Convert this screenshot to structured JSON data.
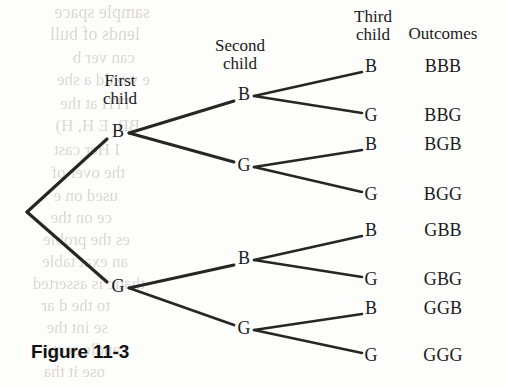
{
  "figure": {
    "caption": "Figure 11-3",
    "caption_x": 31,
    "caption_y": 341
  },
  "columns": [
    {
      "name": "first-child",
      "line1": "First",
      "line2": "child",
      "x": 120,
      "y": 72
    },
    {
      "name": "second-child",
      "line1": "Second",
      "line2": "child",
      "x": 240,
      "y": 37
    },
    {
      "name": "third-child",
      "line1": "Third",
      "line2": "child",
      "x": 373,
      "y": 8
    },
    {
      "name": "outcomes",
      "line1": "Outcomes",
      "line2": "",
      "x": 443,
      "y": 25
    }
  ],
  "tree": {
    "root": {
      "x": 27,
      "y": 212
    },
    "level1": [
      {
        "label": "B",
        "x": 118,
        "y": 133
      },
      {
        "label": "G",
        "x": 118,
        "y": 288
      }
    ],
    "level2": [
      {
        "label": "B",
        "x": 244,
        "y": 96,
        "parent": 0
      },
      {
        "label": "G",
        "x": 244,
        "y": 167,
        "parent": 0
      },
      {
        "label": "B",
        "x": 244,
        "y": 260,
        "parent": 1
      },
      {
        "label": "G",
        "x": 244,
        "y": 330,
        "parent": 1
      }
    ],
    "level3": [
      {
        "label": "B",
        "x": 371,
        "y": 68,
        "parent": 0,
        "outcome": "BBB"
      },
      {
        "label": "G",
        "x": 371,
        "y": 117,
        "parent": 0,
        "outcome": "BBG"
      },
      {
        "label": "B",
        "x": 371,
        "y": 146,
        "parent": 1,
        "outcome": "BGB"
      },
      {
        "label": "G",
        "x": 371,
        "y": 196,
        "parent": 1,
        "outcome": "BGG"
      },
      {
        "label": "B",
        "x": 371,
        "y": 232,
        "parent": 2,
        "outcome": "GBB"
      },
      {
        "label": "G",
        "x": 371,
        "y": 281,
        "parent": 2,
        "outcome": "GBG"
      },
      {
        "label": "B",
        "x": 371,
        "y": 310,
        "parent": 3,
        "outcome": "GGB"
      },
      {
        "label": "G",
        "x": 371,
        "y": 357,
        "parent": 3,
        "outcome": "GGG"
      }
    ],
    "outcome_x": 443
  },
  "style": {
    "line_color": "#262626",
    "text_color": "#1a1a1a",
    "background": "#fdfdfc",
    "bleed_color": "#d9d6d2"
  },
  "bleed_text": [
    {
      "text": "sample space",
      "x": 150,
      "y": 2,
      "size": 18
    },
    {
      "text": "lends of bull",
      "x": 140,
      "y": 24,
      "size": 18
    },
    {
      "text": "can ver b",
      "x": 135,
      "y": 48,
      "size": 17
    },
    {
      "text": "e would a she",
      "x": 150,
      "y": 70,
      "size": 17
    },
    {
      "text": "ITH at the",
      "x": 130,
      "y": 94,
      "size": 17
    },
    {
      "text": "BB, E H, H)",
      "x": 140,
      "y": 116,
      "size": 17
    },
    {
      "text": "I Her cast",
      "x": 120,
      "y": 140,
      "size": 17
    },
    {
      "text": "the over of",
      "x": 125,
      "y": 163,
      "size": 17
    },
    {
      "text": "used on e",
      "x": 118,
      "y": 186,
      "size": 17
    },
    {
      "text": "ce on the",
      "x": 112,
      "y": 208,
      "size": 17
    },
    {
      "text": "es the proble",
      "x": 130,
      "y": 230,
      "size": 17
    },
    {
      "text": "an exat table",
      "x": 128,
      "y": 252,
      "size": 17
    },
    {
      "text": "thatic is asserted",
      "x": 145,
      "y": 274,
      "size": 17
    },
    {
      "text": "to the d ar",
      "x": 110,
      "y": 296,
      "size": 17
    },
    {
      "text": "se int the",
      "x": 108,
      "y": 318,
      "size": 17
    },
    {
      "text": "andle sect",
      "x": 120,
      "y": 340,
      "size": 17
    },
    {
      "text": "ose it tha",
      "x": 105,
      "y": 362,
      "size": 17
    }
  ]
}
